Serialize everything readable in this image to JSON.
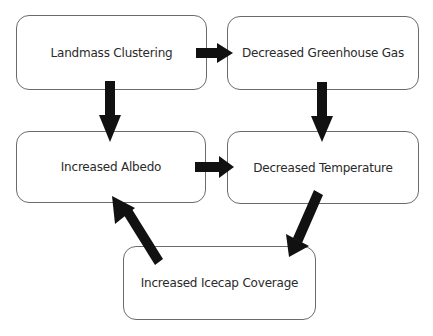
{
  "diagram": {
    "nodes": [
      {
        "id": "landmass",
        "label": "Landmass Clustering"
      },
      {
        "id": "greenhouse",
        "label": "Decreased Greenhouse Gas"
      },
      {
        "id": "albedo",
        "label": "Increased Albedo"
      },
      {
        "id": "temperature",
        "label": "Decreased Temperature"
      },
      {
        "id": "icecap",
        "label": "Increased Icecap Coverage"
      }
    ],
    "edges": [
      {
        "from": "landmass",
        "to": "greenhouse"
      },
      {
        "from": "landmass",
        "to": "albedo"
      },
      {
        "from": "greenhouse",
        "to": "temperature"
      },
      {
        "from": "albedo",
        "to": "temperature"
      },
      {
        "from": "temperature",
        "to": "icecap"
      },
      {
        "from": "icecap",
        "to": "albedo"
      }
    ],
    "colors": {
      "arrow": "#111111",
      "border": "#6b6b6b",
      "text": "#2a2a2a"
    }
  }
}
